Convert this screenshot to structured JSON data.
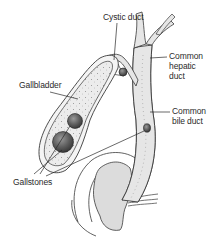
{
  "diagram": {
    "background_color": "#ffffff",
    "line_color": "#3a3a3a",
    "fill_light": "#e8e8e8",
    "fill_stone": "#6a6a6a",
    "labels": {
      "cystic_duct": "Cystic duct",
      "gallbladder": "Gallbladder",
      "common_hepatic_duct": {
        "line1": "Common",
        "line2": "hepatic",
        "line3": "duct"
      },
      "common_bile_duct": {
        "line1": "Common",
        "line2": "bile duct"
      },
      "gallstones": "Gallstones"
    }
  }
}
